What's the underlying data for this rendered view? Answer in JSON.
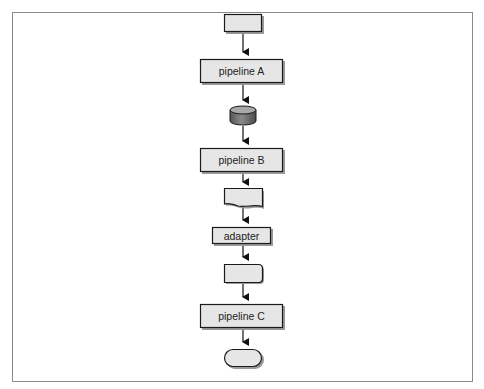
{
  "diagram": {
    "type": "flowchart",
    "direction": "top-to-bottom",
    "colors": {
      "frame": "#8a8a8a",
      "node_fill": "#e6e6e6",
      "node_stroke": "#1a1a1a",
      "shadow": "#9a9a9a",
      "cylinder_fill": "#7a7a7a",
      "cylinder_top": "#a8a8a8",
      "arrow": "#111111"
    },
    "nodes": [
      {
        "id": "start",
        "shape": "rectangle",
        "label": ""
      },
      {
        "id": "pipelineA",
        "shape": "process",
        "label": "pipeline A"
      },
      {
        "id": "store",
        "shape": "cylinder",
        "label": ""
      },
      {
        "id": "pipelineB",
        "shape": "process",
        "label": "pipeline B"
      },
      {
        "id": "input",
        "shape": "manual-input",
        "label": ""
      },
      {
        "id": "adapter",
        "shape": "process",
        "label": "adapter"
      },
      {
        "id": "output",
        "shape": "rounded-rectangle",
        "label": ""
      },
      {
        "id": "pipelineC",
        "shape": "process",
        "label": "pipeline C"
      },
      {
        "id": "end",
        "shape": "terminator",
        "label": ""
      }
    ],
    "edges": [
      {
        "from": "start",
        "to": "pipelineA"
      },
      {
        "from": "pipelineA",
        "to": "store"
      },
      {
        "from": "store",
        "to": "pipelineB"
      },
      {
        "from": "pipelineB",
        "to": "input"
      },
      {
        "from": "input",
        "to": "adapter"
      },
      {
        "from": "adapter",
        "to": "output"
      },
      {
        "from": "output",
        "to": "pipelineC"
      },
      {
        "from": "pipelineC",
        "to": "end"
      }
    ]
  }
}
